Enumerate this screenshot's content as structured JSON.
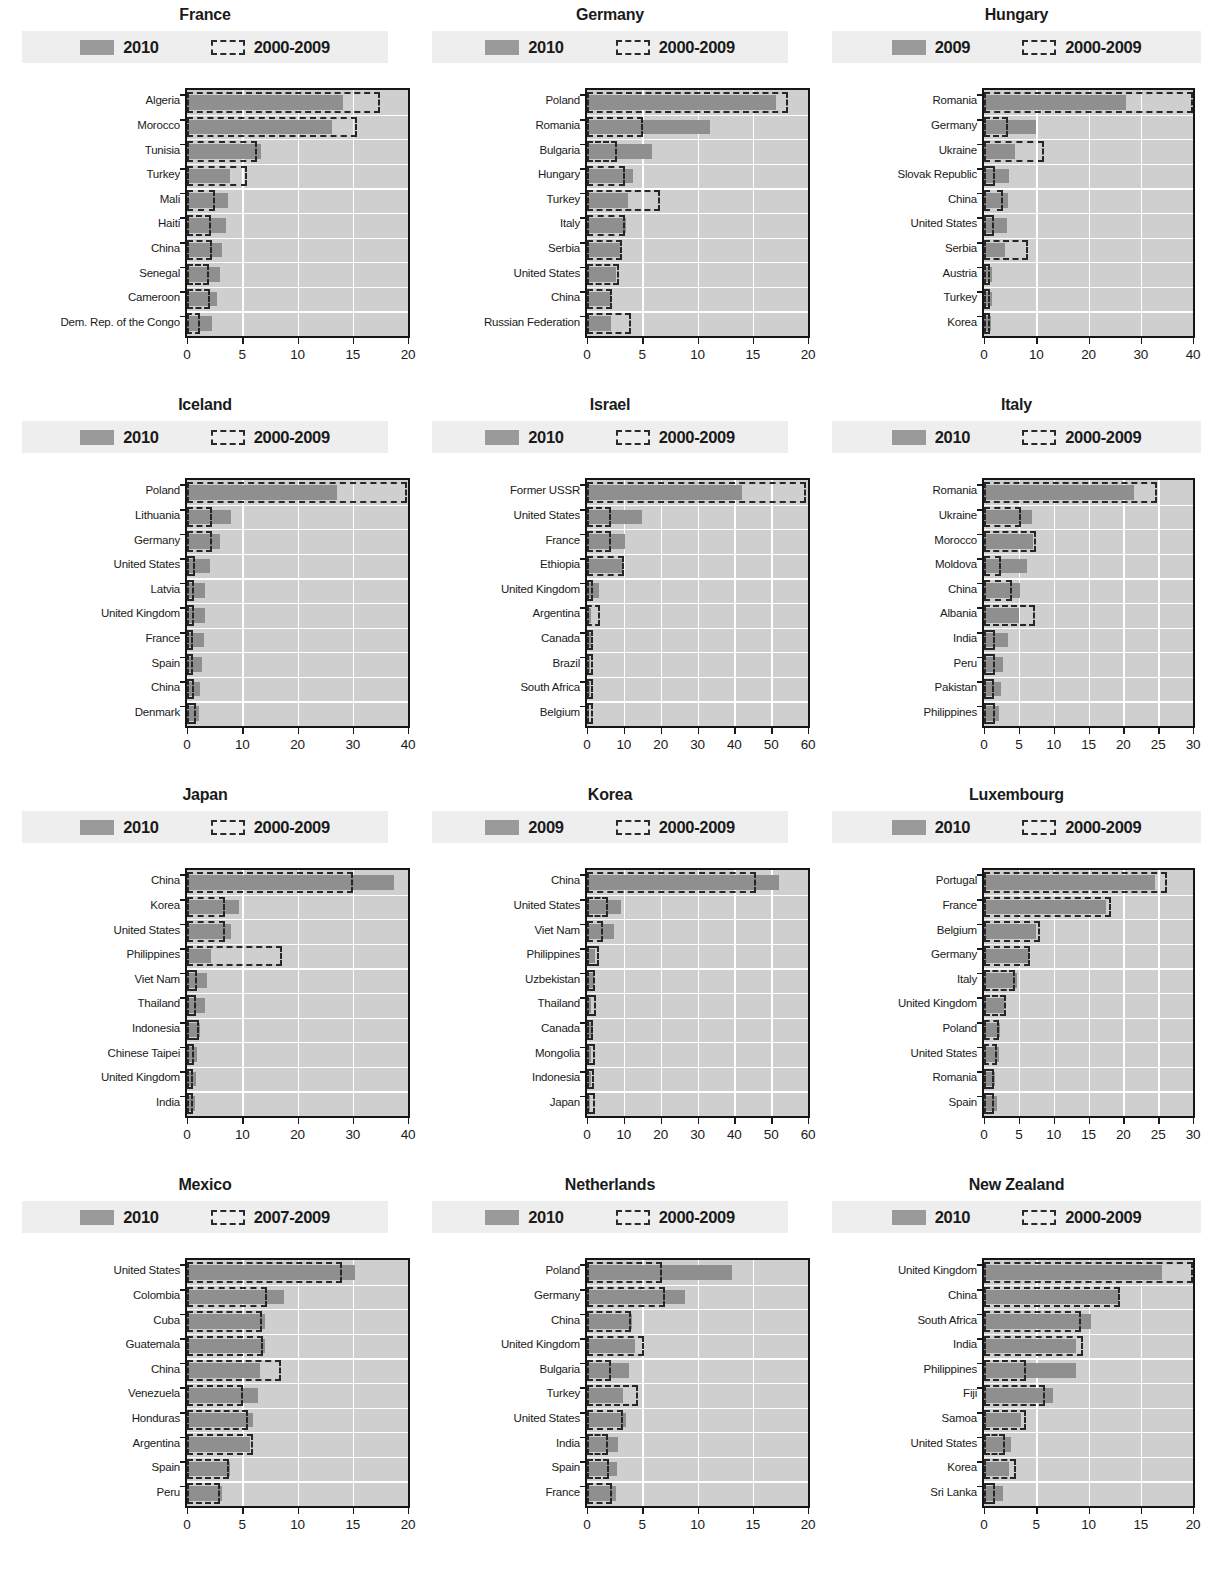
{
  "legend": {
    "swatch_solid_name": "solid-bar-swatch",
    "swatch_dash_name": "dashed-outline-swatch"
  },
  "chart_data": [
    {
      "type": "bar",
      "orientation": "horizontal",
      "title": "France",
      "legend": [
        "2010",
        "2000-2009"
      ],
      "xlabel": "",
      "ylabel": "",
      "xlim": [
        0,
        20
      ],
      "xticks": [
        0,
        5,
        10,
        15,
        20
      ],
      "grid": true,
      "categories": [
        "Algeria",
        "Morocco",
        "Tunisia",
        "Turkey",
        "Mali",
        "Haiti",
        "China",
        "Senegal",
        "Cameroon",
        "Dem. Rep. of the Congo"
      ],
      "series": [
        {
          "name": "2010",
          "values": [
            14.1,
            13.1,
            6.7,
            3.9,
            3.7,
            3.5,
            3.2,
            3.0,
            2.7,
            2.3
          ]
        },
        {
          "name": "2000-2009",
          "values": [
            17.5,
            15.4,
            6.3,
            5.4,
            2.5,
            2.2,
            2.3,
            2.0,
            2.1,
            1.2
          ]
        }
      ]
    },
    {
      "type": "bar",
      "orientation": "horizontal",
      "title": "Germany",
      "legend": [
        "2010",
        "2000-2009"
      ],
      "xlabel": "",
      "ylabel": "",
      "xlim": [
        0,
        20
      ],
      "xticks": [
        0,
        5,
        10,
        15,
        20
      ],
      "grid": true,
      "categories": [
        "Poland",
        "Romania",
        "Bulgaria",
        "Hungary",
        "Turkey",
        "Italy",
        "Serbia",
        "United States",
        "China",
        "Russian Federation"
      ],
      "series": [
        {
          "name": "2010",
          "values": [
            17.1,
            11.1,
            5.9,
            4.2,
            3.7,
            3.5,
            3.0,
            2.6,
            2.2,
            2.2
          ]
        },
        {
          "name": "2000-2009",
          "values": [
            18.2,
            5.1,
            2.7,
            3.4,
            6.6,
            3.4,
            3.2,
            2.9,
            2.3,
            4.0
          ]
        }
      ]
    },
    {
      "type": "bar",
      "orientation": "horizontal",
      "title": "Hungary",
      "legend": [
        "2009",
        "2000-2009"
      ],
      "xlabel": "",
      "ylabel": "",
      "xlim": [
        0,
        40
      ],
      "xticks": [
        0,
        10,
        20,
        30,
        40
      ],
      "grid": true,
      "categories": [
        "Romania",
        "Germany",
        "Ukraine",
        "Slovak Republic",
        "China",
        "United States",
        "Serbia",
        "Austria",
        "Turkey",
        "Korea"
      ],
      "series": [
        {
          "name": "2009",
          "values": [
            27.2,
            10.0,
            6.0,
            4.7,
            4.5,
            4.4,
            4.0,
            1.6,
            1.5,
            1.4
          ]
        },
        {
          "name": "2000-2009",
          "values": [
            40.0,
            4.5,
            11.4,
            2.2,
            3.6,
            2.0,
            8.4,
            1.0,
            0.9,
            0.7
          ]
        }
      ]
    },
    {
      "type": "bar",
      "orientation": "horizontal",
      "title": "Iceland",
      "legend": [
        "2010",
        "2000-2009"
      ],
      "xlabel": "",
      "ylabel": "",
      "xlim": [
        0,
        40
      ],
      "xticks": [
        0,
        10,
        20,
        30,
        40
      ],
      "grid": true,
      "categories": [
        "Poland",
        "Lithuania",
        "Germany",
        "United States",
        "Latvia",
        "United Kingdom",
        "France",
        "Spain",
        "China",
        "Denmark"
      ],
      "series": [
        {
          "name": "2010",
          "values": [
            27.1,
            7.9,
            6.0,
            4.2,
            3.3,
            3.2,
            3.0,
            2.7,
            2.3,
            2.1
          ]
        },
        {
          "name": "2000-2009",
          "values": [
            39.8,
            4.5,
            4.6,
            1.5,
            1.2,
            1.2,
            0.9,
            0.8,
            1.3,
            1.6
          ]
        }
      ]
    },
    {
      "type": "bar",
      "orientation": "horizontal",
      "title": "Israel",
      "legend": [
        "2010",
        "2000-2009"
      ],
      "xlabel": "",
      "ylabel": "",
      "xlim": [
        0,
        60
      ],
      "xticks": [
        0,
        10,
        20,
        30,
        40,
        50,
        60
      ],
      "grid": true,
      "categories": [
        "Former USSR",
        "United States",
        "France",
        "Ethiopia",
        "United Kingdom",
        "Argentina",
        "Canada",
        "Brazil",
        "South Africa",
        "Belgium"
      ],
      "series": [
        {
          "name": "2010",
          "values": [
            42.0,
            14.8,
            10.3,
            9.8,
            3.3,
            1.1,
            1.0,
            0.9,
            0.7,
            0.6
          ]
        },
        {
          "name": "2000-2009",
          "values": [
            59.5,
            6.4,
            6.5,
            10.0,
            1.3,
            3.6,
            0.8,
            0.7,
            0.6,
            0.6
          ]
        }
      ]
    },
    {
      "type": "bar",
      "orientation": "horizontal",
      "title": "Italy",
      "legend": [
        "2010",
        "2000-2009"
      ],
      "xlabel": "",
      "ylabel": "",
      "xlim": [
        0,
        30
      ],
      "xticks": [
        0,
        5,
        10,
        15,
        20,
        25,
        30
      ],
      "grid": true,
      "categories": [
        "Romania",
        "Ukraine",
        "Morocco",
        "Moldova",
        "China",
        "Albania",
        "India",
        "Peru",
        "Pakistan",
        "Philippines"
      ],
      "series": [
        {
          "name": "2010",
          "values": [
            21.6,
            6.9,
            7.0,
            6.2,
            5.2,
            5.0,
            3.4,
            2.7,
            2.4,
            2.2
          ]
        },
        {
          "name": "2000-2009",
          "values": [
            24.8,
            5.3,
            7.5,
            2.5,
            4.0,
            7.3,
            1.6,
            1.6,
            1.5,
            1.6
          ]
        }
      ]
    },
    {
      "type": "bar",
      "orientation": "horizontal",
      "title": "Japan",
      "legend": [
        "2010",
        "2000-2009"
      ],
      "xlabel": "",
      "ylabel": "",
      "xlim": [
        0,
        40
      ],
      "xticks": [
        0,
        10,
        20,
        30,
        40
      ],
      "grid": true,
      "categories": [
        "China",
        "Korea",
        "United States",
        "Philippines",
        "Viet Nam",
        "Thailand",
        "Indonesia",
        "Chinese Taipei",
        "United Kingdom",
        "India"
      ],
      "series": [
        {
          "name": "2010",
          "values": [
            37.5,
            9.5,
            8.0,
            4.3,
            3.6,
            3.3,
            2.4,
            1.9,
            1.7,
            1.4
          ]
        },
        {
          "name": "2000-2009",
          "values": [
            30.0,
            6.9,
            6.8,
            17.2,
            1.9,
            1.7,
            2.1,
            1.3,
            1.1,
            1.1
          ]
        }
      ]
    },
    {
      "type": "bar",
      "orientation": "horizontal",
      "title": "Korea",
      "legend": [
        "2009",
        "2000-2009"
      ],
      "xlabel": "",
      "ylabel": "",
      "xlim": [
        0,
        60
      ],
      "xticks": [
        0,
        10,
        20,
        30,
        40,
        50,
        60
      ],
      "grid": true,
      "categories": [
        "China",
        "United States",
        "Viet Nam",
        "Philippines",
        "Uzbekistan",
        "Thailand",
        "Canada",
        "Mongolia",
        "Indonesia",
        "Japan"
      ],
      "series": [
        {
          "name": "2009",
          "values": [
            52.0,
            9.2,
            7.3,
            2.1,
            2.0,
            1.2,
            1.7,
            1.1,
            1.0,
            0.9
          ]
        },
        {
          "name": "2000-2009",
          "values": [
            46.0,
            5.7,
            4.4,
            3.3,
            2.2,
            2.5,
            1.0,
            2.2,
            2.0,
            2.1
          ]
        }
      ]
    },
    {
      "type": "bar",
      "orientation": "horizontal",
      "title": "Luxembourg",
      "legend": [
        "2010",
        "2000-2009"
      ],
      "xlabel": "",
      "ylabel": "",
      "xlim": [
        0,
        30
      ],
      "xticks": [
        0,
        5,
        10,
        15,
        20,
        25,
        30
      ],
      "grid": true,
      "categories": [
        "Portugal",
        "France",
        "Belgium",
        "Germany",
        "Italy",
        "United Kingdom",
        "Poland",
        "United States",
        "Romania",
        "Spain"
      ],
      "series": [
        {
          "name": "2010",
          "values": [
            24.6,
            17.5,
            7.4,
            6.5,
            4.8,
            2.8,
            2.3,
            2.2,
            1.6,
            1.9
          ]
        },
        {
          "name": "2000-2009",
          "values": [
            26.3,
            18.2,
            8.1,
            6.6,
            4.4,
            3.1,
            2.2,
            1.9,
            1.4,
            1.5
          ]
        }
      ]
    },
    {
      "type": "bar",
      "orientation": "horizontal",
      "title": "Mexico",
      "legend": [
        "2010",
        "2007-2009"
      ],
      "xlabel": "",
      "ylabel": "",
      "xlim": [
        0,
        20
      ],
      "xticks": [
        0,
        5,
        10,
        15,
        20
      ],
      "grid": true,
      "categories": [
        "United States",
        "Colombia",
        "Cuba",
        "Guatemala",
        "China",
        "Venezuela",
        "Honduras",
        "Argentina",
        "Spain",
        "Peru"
      ],
      "series": [
        {
          "name": "2010",
          "values": [
            15.2,
            8.8,
            7.1,
            7.1,
            6.6,
            6.4,
            6.0,
            5.7,
            3.9,
            3.2
          ]
        },
        {
          "name": "2007-2009",
          "values": [
            14.0,
            7.2,
            6.8,
            6.9,
            8.5,
            5.1,
            5.5,
            6.0,
            3.8,
            3.0
          ]
        }
      ]
    },
    {
      "type": "bar",
      "orientation": "horizontal",
      "title": "Netherlands",
      "legend": [
        "2010",
        "2000-2009"
      ],
      "xlabel": "",
      "ylabel": "",
      "xlim": [
        0,
        20
      ],
      "xticks": [
        0,
        5,
        10,
        15,
        20
      ],
      "grid": true,
      "categories": [
        "Poland",
        "Germany",
        "China",
        "United Kingdom",
        "Bulgaria",
        "Turkey",
        "United States",
        "India",
        "Spain",
        "France"
      ],
      "series": [
        {
          "name": "2010",
          "values": [
            13.1,
            8.9,
            4.1,
            4.3,
            3.8,
            3.3,
            3.5,
            2.8,
            2.7,
            2.6
          ]
        },
        {
          "name": "2000-2009",
          "values": [
            6.8,
            7.1,
            4.0,
            5.2,
            2.2,
            4.6,
            3.3,
            1.9,
            2.0,
            2.3
          ]
        }
      ]
    },
    {
      "type": "bar",
      "orientation": "horizontal",
      "title": "New Zealand",
      "legend": [
        "2010",
        "2000-2009"
      ],
      "xlabel": "",
      "ylabel": "",
      "xlim": [
        0,
        20
      ],
      "xticks": [
        0,
        5,
        10,
        15,
        20
      ],
      "grid": true,
      "categories": [
        "United Kingdom",
        "China",
        "South Africa",
        "India",
        "Philippines",
        "Fiji",
        "Samoa",
        "United States",
        "Korea",
        "Sri Lanka"
      ],
      "series": [
        {
          "name": "2010",
          "values": [
            17.0,
            12.9,
            10.2,
            8.8,
            8.8,
            6.6,
            3.5,
            2.6,
            2.4,
            1.8
          ]
        },
        {
          "name": "2000-2009",
          "values": [
            20.0,
            13.0,
            9.3,
            9.5,
            4.0,
            5.8,
            4.0,
            2.0,
            3.1,
            1.1
          ]
        }
      ]
    }
  ]
}
